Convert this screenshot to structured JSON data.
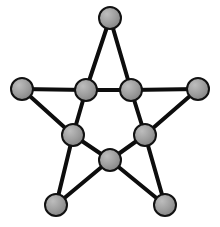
{
  "figure": {
    "background_color": "#ffffff",
    "width": 220,
    "height": 227
  },
  "style": {
    "node_fill": "#9a9a9a",
    "node_highlight": "#bdbdbd",
    "node_shade": "#7d7d7d",
    "node_stroke": "#111111",
    "node_stroke_width": 2,
    "node_radius": 11,
    "edge_color": "#0d0d0d",
    "edge_width": 4
  },
  "graph": {
    "node_count": 10,
    "edge_count": 15,
    "nodes": [
      {
        "id": "apex",
        "label": "",
        "x": 110,
        "y": 18,
        "role": "outer-point-top"
      },
      {
        "id": "left-outer",
        "label": "",
        "x": 22,
        "y": 89,
        "role": "outer-point-left"
      },
      {
        "id": "right-outer",
        "label": "",
        "x": 198,
        "y": 89,
        "role": "outer-point-right"
      },
      {
        "id": "bottom-left-outer",
        "label": "",
        "x": 56,
        "y": 205,
        "role": "outer-point-bottom-left"
      },
      {
        "id": "bottom-right-outer",
        "label": "",
        "x": 165,
        "y": 205,
        "role": "outer-point-bottom-right"
      },
      {
        "id": "inner-top-left",
        "label": "",
        "x": 86,
        "y": 90,
        "role": "inner-vertex"
      },
      {
        "id": "inner-top-right",
        "label": "",
        "x": 131,
        "y": 90,
        "role": "inner-vertex"
      },
      {
        "id": "inner-mid-left",
        "label": "",
        "x": 73,
        "y": 135,
        "role": "inner-vertex"
      },
      {
        "id": "inner-mid-right",
        "label": "",
        "x": 145,
        "y": 135,
        "role": "inner-vertex"
      },
      {
        "id": "inner-bottom",
        "label": "",
        "x": 110,
        "y": 160,
        "role": "inner-vertex"
      }
    ],
    "edges": [
      {
        "from": "apex",
        "to": "inner-top-left"
      },
      {
        "from": "apex",
        "to": "inner-top-right"
      },
      {
        "from": "inner-top-left",
        "to": "inner-top-right"
      },
      {
        "from": "left-outer",
        "to": "inner-top-left"
      },
      {
        "from": "left-outer",
        "to": "inner-mid-left"
      },
      {
        "from": "right-outer",
        "to": "inner-top-right"
      },
      {
        "from": "right-outer",
        "to": "inner-mid-right"
      },
      {
        "from": "inner-top-left",
        "to": "inner-mid-left"
      },
      {
        "from": "inner-top-right",
        "to": "inner-mid-right"
      },
      {
        "from": "inner-mid-left",
        "to": "inner-bottom"
      },
      {
        "from": "inner-mid-right",
        "to": "inner-bottom"
      },
      {
        "from": "inner-mid-left",
        "to": "bottom-left-outer"
      },
      {
        "from": "inner-mid-right",
        "to": "bottom-right-outer"
      },
      {
        "from": "inner-bottom",
        "to": "bottom-left-outer"
      },
      {
        "from": "inner-bottom",
        "to": "bottom-right-outer"
      }
    ]
  }
}
